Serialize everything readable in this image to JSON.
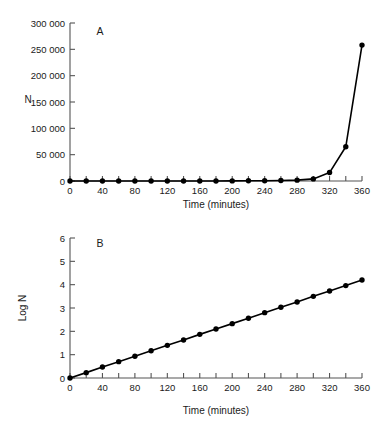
{
  "figure": {
    "panel_a_label": "A",
    "panel_b_label": "B"
  },
  "chart_data": [
    {
      "id": "panel-a",
      "type": "line",
      "title": "A",
      "xlabel": "Time (minutes)",
      "ylabel": "N",
      "xlim": [
        0,
        360
      ],
      "ylim": [
        0,
        300000
      ],
      "grid": false,
      "legend": "none",
      "xticks": [
        0,
        20,
        40,
        60,
        80,
        100,
        120,
        140,
        160,
        180,
        200,
        220,
        240,
        260,
        280,
        300,
        320,
        340,
        360
      ],
      "xtick_labels": [
        "0",
        "",
        "40",
        "",
        "80",
        "",
        "120",
        "",
        "160",
        "",
        "200",
        "",
        "240",
        "",
        "280",
        "",
        "320",
        "",
        "360"
      ],
      "yticks": [
        0,
        50000,
        100000,
        150000,
        200000,
        250000,
        300000
      ],
      "ytick_labels": [
        "0",
        "50 000",
        "100 000",
        "150 000",
        "200 000",
        "250 000",
        "300 000"
      ],
      "x": [
        0,
        20,
        40,
        60,
        80,
        100,
        120,
        140,
        160,
        180,
        200,
        220,
        240,
        260,
        280,
        300,
        320,
        340,
        360
      ],
      "values": [
        1,
        2,
        3,
        5,
        9,
        15,
        25,
        42,
        71,
        120,
        202,
        340,
        573,
        965,
        1625,
        4000,
        16000,
        65000,
        258000
      ],
      "series_name": "N",
      "marker": "filled-circle",
      "color": "#000000"
    },
    {
      "id": "panel-b",
      "type": "line",
      "title": "B",
      "xlabel": "Time (minutes)",
      "ylabel": "Log N",
      "xlim": [
        0,
        360
      ],
      "ylim": [
        0,
        6
      ],
      "grid": false,
      "legend": "none",
      "xticks": [
        0,
        20,
        40,
        60,
        80,
        100,
        120,
        140,
        160,
        180,
        200,
        220,
        240,
        260,
        280,
        300,
        320,
        340,
        360
      ],
      "xtick_labels": [
        "0",
        "",
        "40",
        "",
        "80",
        "",
        "120",
        "",
        "160",
        "",
        "200",
        "",
        "240",
        "",
        "280",
        "",
        "320",
        "",
        "360"
      ],
      "yticks": [
        0,
        1,
        2,
        3,
        4,
        5,
        6
      ],
      "ytick_labels": [
        "0",
        "1",
        "2",
        "3",
        "4",
        "5",
        "6"
      ],
      "x": [
        0,
        20,
        40,
        60,
        80,
        100,
        120,
        140,
        160,
        180,
        200,
        220,
        240,
        260,
        280,
        300,
        320,
        340,
        360
      ],
      "values": [
        0.0,
        0.23,
        0.47,
        0.7,
        0.93,
        1.17,
        1.4,
        1.63,
        1.87,
        2.1,
        2.33,
        2.56,
        2.8,
        3.03,
        3.26,
        3.5,
        3.73,
        3.96,
        4.2
      ],
      "series_name": "Log N",
      "marker": "filled-circle",
      "color": "#000000"
    }
  ]
}
